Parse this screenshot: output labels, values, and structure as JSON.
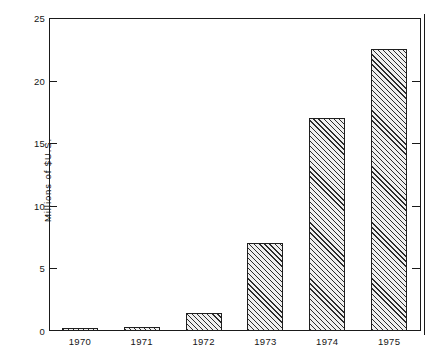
{
  "chart_data": {
    "type": "bar",
    "title": "",
    "xlabel": "",
    "ylabel": "Millions of $U.S.",
    "categories": [
      "1970",
      "1971",
      "1972",
      "1973",
      "1974",
      "1975"
    ],
    "values": [
      0.25,
      0.35,
      1.45,
      7.0,
      17.0,
      22.5
    ],
    "ylim": [
      0,
      25
    ],
    "yticks": [
      0,
      5,
      10,
      15,
      20,
      25
    ],
    "ytick_labels": [
      "0",
      "5",
      "10",
      "15",
      "20",
      "25"
    ],
    "grid": false,
    "legend": null,
    "bar_fill": "diagonal-hatch",
    "bar_edge_color": "#1f1f1f",
    "axis_color": "#1a1a1a",
    "background": "#ffffff"
  }
}
